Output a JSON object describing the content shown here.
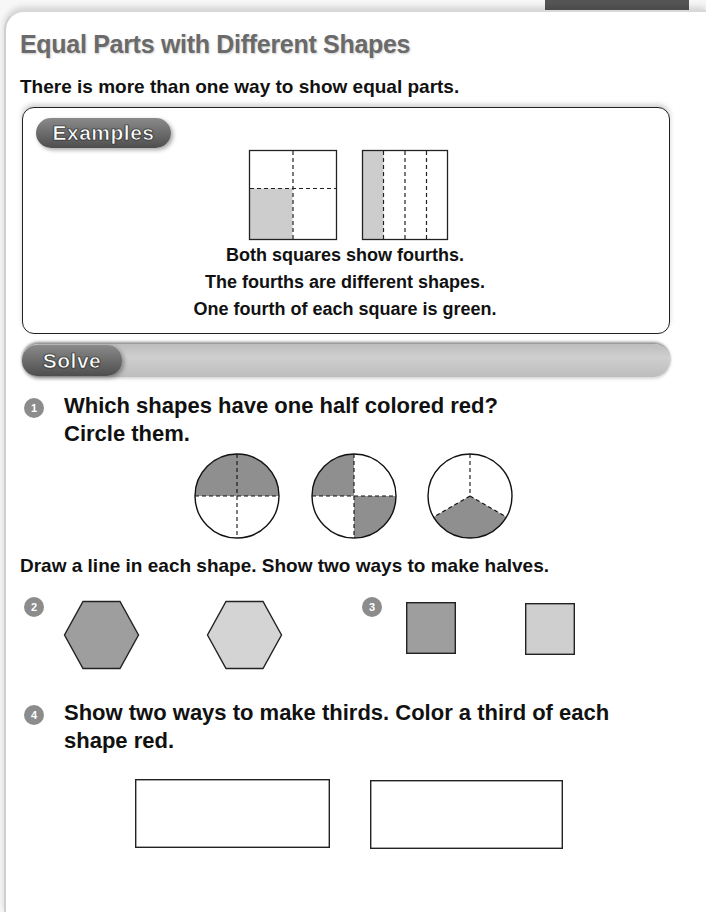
{
  "page": {
    "title": "Equal Parts with Different Shapes",
    "subtitle": "There is more than one way to show equal parts."
  },
  "examples": {
    "label": "Examples",
    "lines": [
      "Both squares show fourths.",
      "The fourths are different shapes.",
      "One fourth of each square is green."
    ],
    "figures": [
      {
        "shape": "square",
        "division": "quadrants",
        "shaded_parts": 1
      },
      {
        "shape": "square",
        "division": "vertical-strips",
        "parts": 4,
        "shaded_parts": 1
      }
    ]
  },
  "solve": {
    "label": "Solve",
    "questions": [
      {
        "number": "1",
        "text_line1": "Which shapes have one half colored red?",
        "text_line2": "Circle them.",
        "figures": [
          {
            "shape": "circle",
            "parts": 4,
            "shaded": "top-half"
          },
          {
            "shape": "circle",
            "parts": 4,
            "shaded": "diagonal-quarters"
          },
          {
            "shape": "circle",
            "parts": 3,
            "shaded": "one-third"
          }
        ]
      },
      {
        "instruction": "Draw a line in each shape. Show two ways to make halves."
      },
      {
        "number": "2",
        "figures": [
          {
            "shape": "hexagon",
            "fill": "#9e9e9e"
          },
          {
            "shape": "hexagon",
            "fill": "#d4d4d4"
          }
        ]
      },
      {
        "number": "3",
        "figures": [
          {
            "shape": "square",
            "fill": "#9e9e9e"
          },
          {
            "shape": "square",
            "fill": "#cfcfcf"
          }
        ]
      },
      {
        "number": "4",
        "text_line1": "Show two ways to make thirds. Color a third of each",
        "text_line2": "shape red.",
        "figures": [
          {
            "shape": "rectangle",
            "fill": "#ffffff"
          },
          {
            "shape": "rectangle",
            "fill": "#ffffff"
          }
        ]
      }
    ]
  },
  "colors": {
    "shade_dark": "#8f8f8f",
    "shade_light": "#cdcdcd",
    "badge": "#8c8c8c",
    "title_gray": "#6a6a6a"
  }
}
